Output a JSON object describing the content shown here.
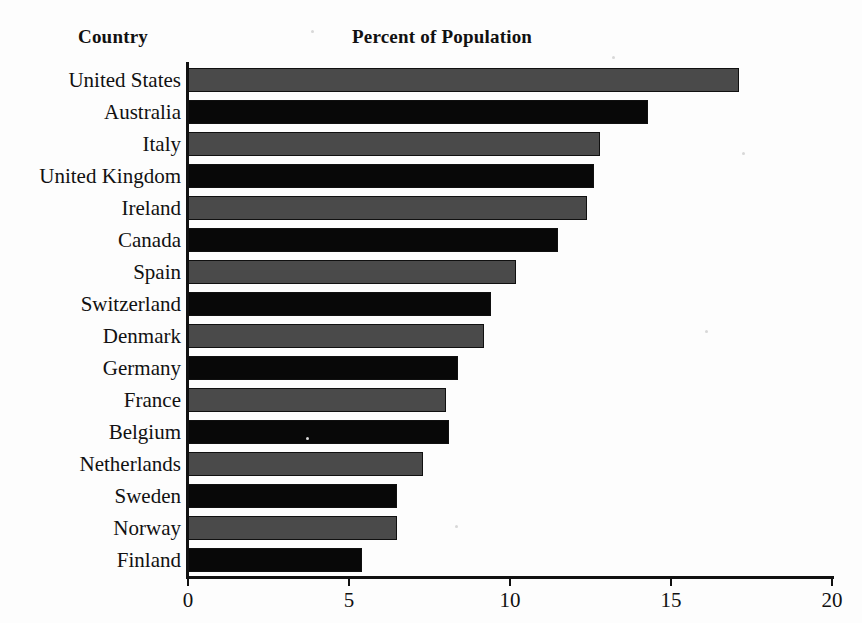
{
  "headers": {
    "category_header": "Country",
    "value_header": "Percent of Population"
  },
  "axis": {
    "ticks": [
      {
        "label": "0",
        "value": 0
      },
      {
        "label": "5",
        "value": 5
      },
      {
        "label": "10",
        "value": 10
      },
      {
        "label": "15",
        "value": 15
      },
      {
        "label": "20",
        "value": 20
      }
    ]
  },
  "colors": {
    "bar_gray": "#4a4a4a",
    "bar_black": "#080808",
    "axis": "#111111",
    "background": "#fdfdfd"
  },
  "chart_data": {
    "type": "bar",
    "orientation": "horizontal",
    "title": "Percent of Population",
    "xlabel": "Percent of Population",
    "ylabel": "Country",
    "xlim": [
      0,
      20
    ],
    "xticks": [
      0,
      5,
      10,
      15,
      20
    ],
    "grid": false,
    "legend": false,
    "categories": [
      "United States",
      "Australia",
      "Italy",
      "United Kingdom",
      "Ireland",
      "Canada",
      "Spain",
      "Switzerland",
      "Denmark",
      "Germany",
      "France",
      "Belgium",
      "Netherlands",
      "Sweden",
      "Norway",
      "Finland"
    ],
    "values": [
      17.1,
      14.3,
      12.8,
      12.6,
      12.4,
      11.5,
      10.2,
      9.4,
      9.2,
      8.4,
      8.0,
      8.1,
      7.3,
      6.5,
      6.5,
      5.4
    ],
    "bar_colors": [
      "gray",
      "black",
      "gray",
      "black",
      "gray",
      "black",
      "gray",
      "black",
      "gray",
      "black",
      "gray",
      "black",
      "gray",
      "black",
      "gray",
      "black"
    ]
  }
}
